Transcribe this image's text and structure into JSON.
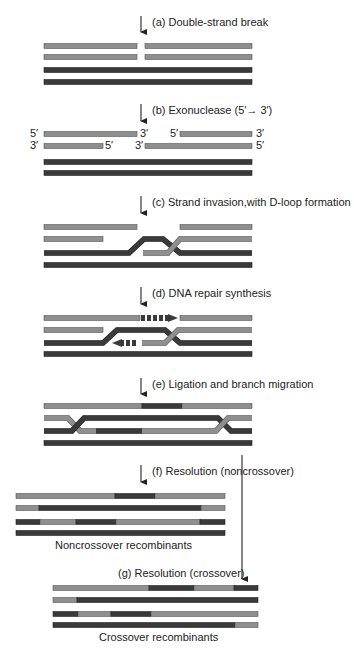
{
  "colors": {
    "light": "#8f8f8f",
    "light_edge": "#555555",
    "dark": "#3a3a3a",
    "dark_edge": "#222222",
    "arrow": "#222222",
    "text": "#222222"
  },
  "steps": [
    {
      "id": "a",
      "label": "(a) Double-strand break",
      "arrow_x": 141,
      "arrow_y1": 16,
      "arrow_y2": 38,
      "label_x": 152,
      "label_y": 26
    },
    {
      "id": "b",
      "label": "(b) Exonuclease (5′→ 3′)",
      "arrow_x": 141,
      "arrow_y1": 104,
      "arrow_y2": 127,
      "label_x": 152,
      "label_y": 114
    },
    {
      "id": "c",
      "label": "(c) Strand invasion,with D-loop formation",
      "arrow_x": 141,
      "arrow_y1": 196,
      "arrow_y2": 219,
      "label_x": 152,
      "label_y": 206
    },
    {
      "id": "d",
      "label": "(d) DNA repair synthesis",
      "arrow_x": 141,
      "arrow_y1": 287,
      "arrow_y2": 310,
      "label_x": 152,
      "label_y": 297
    },
    {
      "id": "e",
      "label": "(e) Ligation and branch migration",
      "arrow_x": 141,
      "arrow_y1": 378,
      "arrow_y2": 400,
      "label_x": 152,
      "label_y": 388
    },
    {
      "id": "f",
      "label": "(f) Resolution (noncrossover)",
      "arrow_x": 141,
      "arrow_y1": 465,
      "arrow_y2": 488,
      "label_x": 152,
      "label_y": 475
    },
    {
      "id": "g",
      "label": "(g) Resolution (crossover)",
      "arrow_x": 242,
      "arrow_y1": 455,
      "arrow_y2": 585,
      "label_x": 118,
      "label_y": 577
    }
  ],
  "end_labels": {
    "b": [
      {
        "text": "5′",
        "x": 30,
        "y": 133
      },
      {
        "text": "3′",
        "x": 140,
        "y": 133
      },
      {
        "text": "5′",
        "x": 170,
        "y": 133
      },
      {
        "text": "3′",
        "x": 256,
        "y": 133
      },
      {
        "text": "3′",
        "x": 30,
        "y": 145
      },
      {
        "text": "5′",
        "x": 105,
        "y": 145
      },
      {
        "text": "3′",
        "x": 135,
        "y": 145
      },
      {
        "text": "5′",
        "x": 256,
        "y": 145
      }
    ]
  },
  "captions": {
    "noncrossover": "Noncrossover recombinants",
    "crossover": "Crossover recombinants"
  },
  "panels": {
    "a": {
      "bars": [
        {
          "x1": 44,
          "x2": 137,
          "y": 46,
          "tone": "light"
        },
        {
          "x1": 145,
          "x2": 252,
          "y": 46,
          "tone": "light"
        },
        {
          "x1": 44,
          "x2": 137,
          "y": 57,
          "tone": "light"
        },
        {
          "x1": 145,
          "x2": 252,
          "y": 57,
          "tone": "light"
        },
        {
          "x1": 44,
          "x2": 252,
          "y": 70,
          "tone": "dark"
        },
        {
          "x1": 44,
          "x2": 252,
          "y": 82,
          "tone": "dark"
        }
      ]
    },
    "b": {
      "bars": [
        {
          "x1": 44,
          "x2": 137,
          "y": 134,
          "tone": "light"
        },
        {
          "x1": 180,
          "x2": 252,
          "y": 134,
          "tone": "light"
        },
        {
          "x1": 44,
          "x2": 103,
          "y": 146,
          "tone": "light"
        },
        {
          "x1": 145,
          "x2": 252,
          "y": 146,
          "tone": "light"
        },
        {
          "x1": 44,
          "x2": 252,
          "y": 162,
          "tone": "dark"
        },
        {
          "x1": 44,
          "x2": 252,
          "y": 173,
          "tone": "dark"
        }
      ]
    },
    "c": {
      "bars": [
        {
          "x1": 44,
          "x2": 137,
          "y": 227,
          "tone": "light"
        },
        {
          "x1": 180,
          "x2": 252,
          "y": 227,
          "tone": "light"
        },
        {
          "x1": 44,
          "x2": 103,
          "y": 239,
          "tone": "light"
        },
        {
          "x1": 44,
          "x2": 252,
          "y": 265,
          "tone": "dark"
        }
      ],
      "paths": [
        {
          "d": "M44,253 L129,253 L144,239 L163,239 L180,253 L252,253",
          "tone": "dark"
        },
        {
          "d": "M143,253 L168,253 L180,239 L252,239",
          "tone": "light"
        }
      ]
    },
    "d": {
      "bars": [
        {
          "x1": 44,
          "x2": 140,
          "y": 318,
          "tone": "light"
        },
        {
          "x1": 180,
          "x2": 252,
          "y": 318,
          "tone": "light"
        },
        {
          "x1": 44,
          "x2": 103,
          "y": 330,
          "tone": "light"
        },
        {
          "x1": 44,
          "x2": 252,
          "y": 354,
          "tone": "dark"
        }
      ],
      "paths": [
        {
          "d": "M44,343 L103,343 L117,330 L165,330 L180,343 L252,343",
          "tone": "dark"
        },
        {
          "d": "M142,343 L165,343 L178,330 L252,330",
          "tone": "light"
        }
      ],
      "dashes_top": {
        "x_start": 141,
        "x_end": 168,
        "y": 318,
        "arrow_tip": 178
      },
      "dashes_bottom": {
        "x_start": 136,
        "x_end": 122,
        "y": 343,
        "arrow_tip": 112
      }
    },
    "e": {
      "bars": [
        {
          "x1": 44,
          "x2": 142,
          "y": 406,
          "tone": "light"
        },
        {
          "x1": 142,
          "x2": 182,
          "y": 406,
          "tone": "dark"
        },
        {
          "x1": 182,
          "x2": 252,
          "y": 406,
          "tone": "light"
        },
        {
          "x1": 44,
          "x2": 252,
          "y": 443,
          "tone": "dark"
        }
      ],
      "paths": [
        {
          "d": "M44,418 L68,418 L80,431 L96,431",
          "tone": "light"
        },
        {
          "d": "M44,431 L72,431 L84,418 L218,418 L231,431 L252,431",
          "tone": "dark"
        },
        {
          "d": "M96,431 L142,431",
          "tone": "dark"
        },
        {
          "d": "M142,431 L216,431 L228,418 L252,418",
          "tone": "light"
        }
      ]
    },
    "f": {
      "bars": [
        {
          "x1": 16,
          "x2": 115,
          "y": 496,
          "tone": "light"
        },
        {
          "x1": 115,
          "x2": 155,
          "y": 496,
          "tone": "dark"
        },
        {
          "x1": 155,
          "x2": 225,
          "y": 496,
          "tone": "light"
        },
        {
          "x1": 16,
          "x2": 39,
          "y": 508,
          "tone": "light"
        },
        {
          "x1": 39,
          "x2": 201,
          "y": 508,
          "tone": "dark"
        },
        {
          "x1": 201,
          "x2": 225,
          "y": 508,
          "tone": "light"
        },
        {
          "x1": 16,
          "x2": 40,
          "y": 522,
          "tone": "dark"
        },
        {
          "x1": 40,
          "x2": 76,
          "y": 522,
          "tone": "light"
        },
        {
          "x1": 76,
          "x2": 116,
          "y": 522,
          "tone": "dark"
        },
        {
          "x1": 116,
          "x2": 200,
          "y": 522,
          "tone": "light"
        },
        {
          "x1": 200,
          "x2": 225,
          "y": 522,
          "tone": "dark"
        },
        {
          "x1": 16,
          "x2": 225,
          "y": 533,
          "tone": "dark"
        }
      ],
      "caption_x": 55,
      "caption_y": 549
    },
    "g": {
      "bars": [
        {
          "x1": 53,
          "x2": 149,
          "y": 588,
          "tone": "light"
        },
        {
          "x1": 149,
          "x2": 194,
          "y": 588,
          "tone": "dark"
        },
        {
          "x1": 194,
          "x2": 234,
          "y": 588,
          "tone": "light"
        },
        {
          "x1": 234,
          "x2": 258,
          "y": 588,
          "tone": "dark"
        },
        {
          "x1": 53,
          "x2": 77,
          "y": 600,
          "tone": "light"
        },
        {
          "x1": 77,
          "x2": 258,
          "y": 600,
          "tone": "dark"
        },
        {
          "x1": 53,
          "x2": 78,
          "y": 614,
          "tone": "dark"
        },
        {
          "x1": 78,
          "x2": 111,
          "y": 614,
          "tone": "light"
        },
        {
          "x1": 111,
          "x2": 151,
          "y": 614,
          "tone": "dark"
        },
        {
          "x1": 151,
          "x2": 258,
          "y": 614,
          "tone": "light"
        },
        {
          "x1": 53,
          "x2": 235,
          "y": 625,
          "tone": "dark"
        },
        {
          "x1": 235,
          "x2": 258,
          "y": 625,
          "tone": "light"
        }
      ],
      "caption_x": 99,
      "caption_y": 641
    }
  }
}
